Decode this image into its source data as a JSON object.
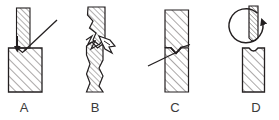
{
  "figure": {
    "type": "technical-line-diagram",
    "width": 279,
    "height": 120,
    "colors": {
      "line": "#231f20",
      "hatch": "#55504f",
      "background": "#ffffff",
      "label_text": "#3a3a3a"
    },
    "panels": [
      {
        "id": "a",
        "label": "A",
        "name": "panel-a-punching",
        "parts": [
          {
            "name": "vertical-hatched-punch",
            "shape": "narrow vertical hatched bar descending onto block"
          },
          {
            "name": "base-hatched-block",
            "shape": "wide hatched rectangular block"
          },
          {
            "name": "down-arrow",
            "shape": "short downward arrow at punch tip"
          },
          {
            "name": "diagonal-tool-line",
            "shape": "diagonal straight line from upper right to contact point"
          }
        ]
      },
      {
        "id": "b",
        "label": "B",
        "name": "panel-b-fracture",
        "parts": [
          {
            "name": "upper-hatched-column",
            "shape": "vertical hatched column, upper segment"
          },
          {
            "name": "lower-hatched-column",
            "shape": "vertical hatched column, lower segment"
          },
          {
            "name": "fracture-zigzag",
            "shape": "jagged zig-zag fracture line across the column mid-height"
          },
          {
            "name": "chip-flake",
            "shape": "detached angular chip to the right of the fracture"
          }
        ]
      },
      {
        "id": "c",
        "label": "C",
        "name": "panel-c-cutting",
        "parts": [
          {
            "name": "vertical-hatched-bar",
            "shape": "tall vertical hatched bar"
          },
          {
            "name": "notch-vee",
            "shape": "v-shaped notch cut into the bar at mid-height"
          },
          {
            "name": "diagonal-tool-line",
            "shape": "diagonal straight line entering the notch from lower left"
          }
        ]
      },
      {
        "id": "d",
        "label": "D",
        "name": "panel-d-drilling",
        "parts": [
          {
            "name": "rotating-drill-bit",
            "shape": "narrow hatched vertical bit with rounded point"
          },
          {
            "name": "rotation-arc-arrow",
            "shape": "near-closed circular arc with arrowhead indicating rotation"
          },
          {
            "name": "workpiece-block",
            "shape": "hatched rectangular workpiece with concave dimple on top edge"
          }
        ]
      }
    ]
  },
  "labels": {
    "a": "A",
    "b": "B",
    "c": "C",
    "d": "D"
  }
}
